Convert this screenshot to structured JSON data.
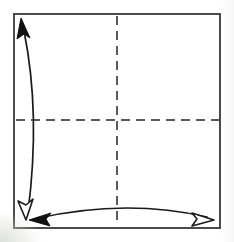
{
  "figure": {
    "caption": "",
    "background_color": "#ffffff",
    "width": 234,
    "height": 242
  },
  "paper": {
    "label": "square paper sheet",
    "shape": "square",
    "stroke_color": "#4a4a4a",
    "stroke_width": 2,
    "fill_color": "#ffffff",
    "x": 14,
    "y": 14,
    "width": 206,
    "height": 214
  },
  "crease_lines": [
    {
      "name": "vertical-crease",
      "label": "vertical center crease",
      "orientation": "vertical",
      "style": "dashed",
      "stroke_color": "#5a5a5a",
      "stroke_width": 2,
      "dash_pattern": "9 6",
      "x1": 117,
      "y1": 16,
      "x2": 117,
      "y2": 226
    },
    {
      "name": "horizontal-crease",
      "label": "horizontal center crease",
      "orientation": "horizontal",
      "style": "dashed",
      "stroke_color": "#5a5a5a",
      "stroke_width": 2,
      "dash_pattern": "9 6",
      "x1": 16,
      "y1": 120,
      "x2": 219,
      "y2": 120
    }
  ],
  "fold_arrows": [
    {
      "name": "vertical-fold-arrow",
      "label": "fold bottom edge up to top edge",
      "orientation": "vertical",
      "stroke_color": "#1a1a1a",
      "stroke_width": 1.7,
      "path": "M 24 31 C 36 90, 36 150, 28 212",
      "head_start": {
        "type": "solid",
        "fill": "#111111"
      },
      "head_end": {
        "type": "hollow",
        "fill": "#ffffff"
      }
    },
    {
      "name": "horizontal-fold-arrow",
      "label": "fold left edge across to right edge",
      "orientation": "horizontal",
      "stroke_color": "#1a1a1a",
      "stroke_width": 1.7,
      "path": "M 34 219 C 95 205, 155 205, 207 217",
      "head_start": {
        "type": "solid",
        "fill": "#111111"
      },
      "head_end": {
        "type": "hollow",
        "fill": "#ffffff"
      }
    }
  ],
  "legend": {
    "solid_arrow_meaning": "valley fold direction",
    "hollow_arrow_meaning": "unfold / return direction",
    "dashed_line_meaning": "crease line"
  }
}
